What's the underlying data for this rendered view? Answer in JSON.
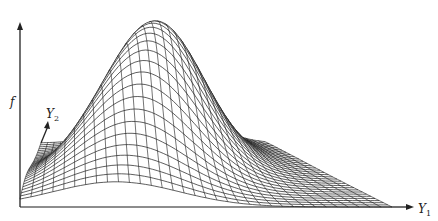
{
  "figure": {
    "type": "3d-wireframe-surface",
    "axes": {
      "vertical": {
        "label": "f"
      },
      "depth": {
        "label": "Y",
        "subscript": "2"
      },
      "horizontal": {
        "label": "Y",
        "subscript": "1"
      }
    },
    "colors": {
      "background": "#ffffff",
      "line": "#1a1a1a",
      "axis": "#222222"
    },
    "surface": {
      "nx": 34,
      "ny": 30,
      "peak_u": 0.42,
      "peak_v": 0.55,
      "sigma_u": 0.17,
      "sigma_v": 0.26,
      "height_px": 150
    },
    "geometry": {
      "origin": [
        20,
        207
      ],
      "back_left": [
        41,
        143
      ],
      "back_right": [
        265,
        143
      ],
      "front_right": [
        392,
        207
      ],
      "f_axis_top": [
        20,
        22
      ],
      "y1_axis_end": [
        414,
        207
      ],
      "y2_axis_end": [
        48,
        121
      ]
    }
  }
}
